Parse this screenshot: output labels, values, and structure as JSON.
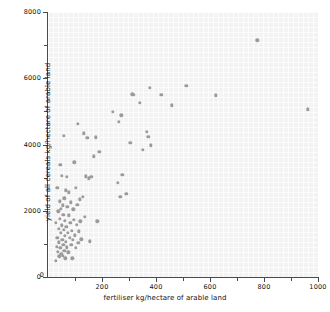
{
  "chart_data": {
    "type": "scatter",
    "title": "",
    "xlabel": "fertiliser kg/hectare of arable land",
    "ylabel": "yield of all cereals kg/hectare of arable land",
    "xlim": [
      0,
      1000
    ],
    "ylim": [
      0,
      8000
    ],
    "xticks": [
      0,
      200,
      400,
      600,
      800,
      1000
    ],
    "xtick_labels": [
      "0",
      "200",
      "400",
      "600",
      "800",
      "1000"
    ],
    "xminor_ticks": [
      100,
      300,
      500,
      700,
      900
    ],
    "yticks": [
      0,
      2000,
      4000,
      6000,
      8000
    ],
    "ytick_labels": [
      "0",
      "2000",
      "4000",
      "6000",
      "8000"
    ],
    "yminor_ticks": [
      1000,
      3000,
      5000,
      7000
    ],
    "grid": true,
    "legend": null,
    "marker": {
      "shape": "circle",
      "color": "#9b9b9b",
      "size": 3.4
    },
    "plot_background": "#f3f3f3",
    "points": [
      [
        28,
        480
      ],
      [
        30,
        1630
      ],
      [
        32,
        920
      ],
      [
        34,
        1180
      ],
      [
        35,
        2700
      ],
      [
        36,
        760
      ],
      [
        38,
        1980
      ],
      [
        40,
        1460
      ],
      [
        41,
        1050
      ],
      [
        42,
        620
      ],
      [
        43,
        2280
      ],
      [
        44,
        1760
      ],
      [
        45,
        3380
      ],
      [
        46,
        880
      ],
      [
        47,
        1340
      ],
      [
        48,
        2050
      ],
      [
        49,
        700
      ],
      [
        50,
        3060
      ],
      [
        52,
        1560
      ],
      [
        53,
        1130
      ],
      [
        54,
        2160
      ],
      [
        55,
        640
      ],
      [
        56,
        1880
      ],
      [
        57,
        980
      ],
      [
        58,
        4270
      ],
      [
        59,
        1420
      ],
      [
        60,
        2380
      ],
      [
        61,
        800
      ],
      [
        62,
        1240
      ],
      [
        63,
        1700
      ],
      [
        64,
        560
      ],
      [
        66,
        2620
      ],
      [
        67,
        1060
      ],
      [
        68,
        1520
      ],
      [
        69,
        900
      ],
      [
        70,
        3020
      ],
      [
        72,
        2120
      ],
      [
        74,
        1340
      ],
      [
        75,
        740
      ],
      [
        76,
        1860
      ],
      [
        78,
        2560
      ],
      [
        80,
        1180
      ],
      [
        82,
        1640
      ],
      [
        84,
        2260
      ],
      [
        86,
        980
      ],
      [
        88,
        1400
      ],
      [
        90,
        560
      ],
      [
        92,
        1120
      ],
      [
        94,
        2040
      ],
      [
        96,
        1720
      ],
      [
        98,
        3460
      ],
      [
        100,
        1260
      ],
      [
        102,
        2700
      ],
      [
        104,
        880
      ],
      [
        106,
        1580
      ],
      [
        108,
        2180
      ],
      [
        110,
        4620
      ],
      [
        112,
        1040
      ],
      [
        115,
        1380
      ],
      [
        118,
        2340
      ],
      [
        120,
        1680
      ],
      [
        124,
        1140
      ],
      [
        128,
        2420
      ],
      [
        132,
        4340
      ],
      [
        136,
        1820
      ],
      [
        140,
        3040
      ],
      [
        145,
        4200
      ],
      [
        150,
        2980
      ],
      [
        155,
        1080
      ],
      [
        160,
        3020
      ],
      [
        170,
        3640
      ],
      [
        178,
        4220
      ],
      [
        182,
        1680
      ],
      [
        190,
        3780
      ],
      [
        240,
        4980
      ],
      [
        258,
        2840
      ],
      [
        262,
        4680
      ],
      [
        268,
        2420
      ],
      [
        272,
        4880
      ],
      [
        275,
        3080
      ],
      [
        290,
        2520
      ],
      [
        305,
        4060
      ],
      [
        312,
        5520
      ],
      [
        318,
        5500
      ],
      [
        340,
        5250
      ],
      [
        352,
        3840
      ],
      [
        366,
        4380
      ],
      [
        372,
        4240
      ],
      [
        376,
        5720
      ],
      [
        380,
        3980
      ],
      [
        420,
        5500
      ],
      [
        458,
        5180
      ],
      [
        512,
        5780
      ],
      [
        622,
        5480
      ],
      [
        775,
        7140
      ],
      [
        962,
        5060
      ]
    ]
  },
  "axes": {
    "x_title": "fertiliser kg/hectare of arable land",
    "y_title": "yield of all cereals kg/hectare of arable land"
  }
}
